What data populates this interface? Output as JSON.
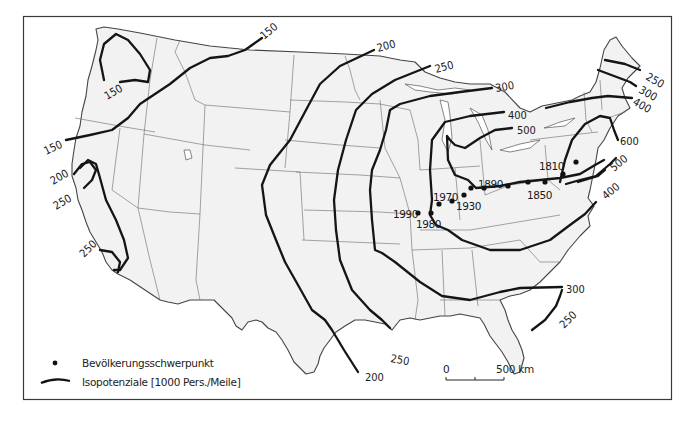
{
  "map": {
    "title": "",
    "subject": "Population potential isolines and population centers of the USA",
    "isolines": [
      {
        "value": "150",
        "label_positions": [
          "nw-montana",
          "oregon-coast",
          "washington-loop"
        ]
      },
      {
        "value": "200",
        "label_positions": [
          "minnesota-north",
          "california-coast",
          "texas-coast"
        ]
      },
      {
        "value": "250",
        "label_positions": [
          "lake-superior",
          "california-coast",
          "los-angeles",
          "texas-coast",
          "maine",
          "florida"
        ]
      },
      {
        "value": "300",
        "label_positions": [
          "michigan-north",
          "new-hampshire",
          "georgia-coast"
        ]
      },
      {
        "value": "400",
        "label_positions": [
          "lake-michigan",
          "massachusetts",
          "virginia-coast"
        ]
      },
      {
        "value": "500",
        "label_positions": [
          "lake-huron",
          "new-jersey"
        ]
      },
      {
        "value": "600",
        "label_positions": [
          "new-york"
        ]
      }
    ],
    "labels": {
      "l150a": "150",
      "l150b": "150",
      "l150c": "150",
      "l200a": "200",
      "l200b": "200",
      "l200c": "200",
      "l250a": "250",
      "l250b": "250",
      "l250c": "250",
      "l250d": "250",
      "l250e": "250",
      "l250f": "250",
      "l300a": "300",
      "l300b": "300",
      "l300c": "300",
      "l400a": "400",
      "l400b": "400",
      "l400c": "400",
      "l500a": "500",
      "l500b": "500",
      "l600a": "600"
    },
    "population_centers": [
      {
        "year": "1810"
      },
      {
        "year": "1850"
      },
      {
        "year": "1890"
      },
      {
        "year": "1930"
      },
      {
        "year": "1970"
      },
      {
        "year": "1980"
      },
      {
        "year": "1990"
      }
    ]
  },
  "scale_bar": {
    "start": "0",
    "end": "500 km"
  },
  "legend": {
    "dot_label": "Bevölkerungsschwerpunkt",
    "line_label": "Isopotenziale [1000 Pers./Meile]"
  }
}
